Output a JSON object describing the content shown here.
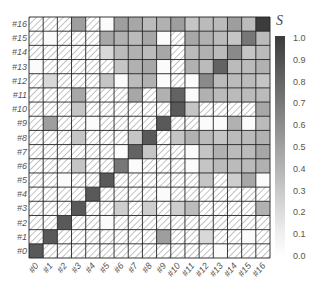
{
  "chart_data": {
    "type": "heatmap",
    "title": "",
    "xlabel": "",
    "ylabel": "",
    "x_categories": [
      "#0",
      "#1",
      "#2",
      "#3",
      "#4",
      "#5",
      "#6",
      "#7",
      "#8",
      "#9",
      "#10",
      "#11",
      "#12",
      "#13",
      "#14",
      "#15",
      "#16"
    ],
    "y_categories": [
      "#0",
      "#1",
      "#2",
      "#3",
      "#4",
      "#5",
      "#6",
      "#7",
      "#8",
      "#9",
      "#10",
      "#11",
      "#12",
      "#13",
      "#14",
      "#15",
      "#16"
    ],
    "note": "null = hatched (no data); rows listed from #0 (bottom) to #16 (top); values estimated from grayscale",
    "matrix": [
      [
        0.85,
        null,
        null,
        null,
        null,
        null,
        null,
        null,
        null,
        null,
        null,
        null,
        null,
        0.02,
        null,
        null,
        null
      ],
      [
        null,
        0.85,
        null,
        null,
        null,
        null,
        null,
        null,
        null,
        0.5,
        null,
        null,
        0.2,
        null,
        null,
        0.02,
        null
      ],
      [
        null,
        null,
        0.85,
        null,
        null,
        0.02,
        null,
        null,
        null,
        null,
        null,
        null,
        null,
        null,
        null,
        null,
        null
      ],
      [
        null,
        null,
        null,
        0.85,
        null,
        null,
        0.25,
        null,
        0.25,
        null,
        0.25,
        0.35,
        null,
        null,
        null,
        null,
        0.4
      ],
      [
        null,
        null,
        null,
        null,
        0.85,
        null,
        null,
        null,
        null,
        0.02,
        null,
        null,
        null,
        null,
        null,
        null,
        null
      ],
      [
        null,
        null,
        0.02,
        null,
        null,
        0.85,
        null,
        null,
        null,
        null,
        null,
        null,
        0.3,
        null,
        0.25,
        0.45,
        0.02
      ],
      [
        null,
        null,
        null,
        0.3,
        null,
        null,
        0.7,
        0.02,
        null,
        null,
        null,
        0.02,
        0.3,
        0.35,
        0.35,
        0.35,
        0.4
      ],
      [
        null,
        null,
        null,
        null,
        null,
        null,
        0.02,
        0.8,
        0.3,
        null,
        null,
        0.02,
        0.3,
        0.4,
        0.35,
        0.35,
        0.45
      ],
      [
        null,
        null,
        null,
        0.3,
        null,
        null,
        null,
        0.3,
        0.85,
        null,
        0.3,
        0.4,
        0.35,
        0.3,
        0.35,
        0.35,
        0.4
      ],
      [
        null,
        0.5,
        null,
        null,
        0.02,
        null,
        null,
        null,
        null,
        0.85,
        null,
        null,
        0.02,
        0.02,
        0.4,
        0.02,
        0.35
      ],
      [
        null,
        null,
        null,
        0.3,
        null,
        null,
        null,
        null,
        null,
        null,
        0.85,
        0.3,
        null,
        null,
        null,
        null,
        0.45
      ],
      [
        null,
        null,
        null,
        0.45,
        null,
        null,
        null,
        0.45,
        null,
        0.4,
        0.8,
        0.02,
        0.4,
        0.35,
        0.35,
        0.35,
        0.35
      ],
      [
        null,
        0.2,
        null,
        null,
        null,
        0.3,
        0.02,
        0.35,
        0.4,
        0.02,
        null,
        0.02,
        0.6,
        0.35,
        0.35,
        0.35,
        0.3
      ],
      [
        0.02,
        null,
        null,
        null,
        null,
        null,
        0.3,
        0.4,
        0.45,
        0.02,
        null,
        0.4,
        0.35,
        0.8,
        0.35,
        0.35,
        0.4
      ],
      [
        null,
        null,
        null,
        null,
        null,
        0.2,
        0.35,
        0.4,
        0.35,
        0.45,
        null,
        0.35,
        0.4,
        0.35,
        0.6,
        0.3,
        0.35
      ],
      [
        null,
        0.02,
        null,
        null,
        null,
        0.45,
        0.4,
        0.35,
        0.45,
        0.02,
        null,
        0.45,
        0.4,
        0.35,
        0.3,
        0.7,
        0.35
      ],
      [
        null,
        null,
        null,
        0.5,
        null,
        0.02,
        0.5,
        0.45,
        0.35,
        0.4,
        0.5,
        0.3,
        0.35,
        0.35,
        0.5,
        0.35,
        1.0
      ]
    ],
    "colorbar": {
      "label": "S",
      "ticks": [
        "1.0",
        "0.9",
        "0.8",
        "0.7",
        "0.6",
        "0.5",
        "0.4",
        "0.3",
        "0.2",
        "0.1",
        "0.0"
      ],
      "range": [
        0.0,
        1.0
      ],
      "color_low": "#ffffff",
      "color_high": "#3c3c3c"
    },
    "hatch_meaning": "no data",
    "grid": true,
    "legend_position": "right"
  }
}
